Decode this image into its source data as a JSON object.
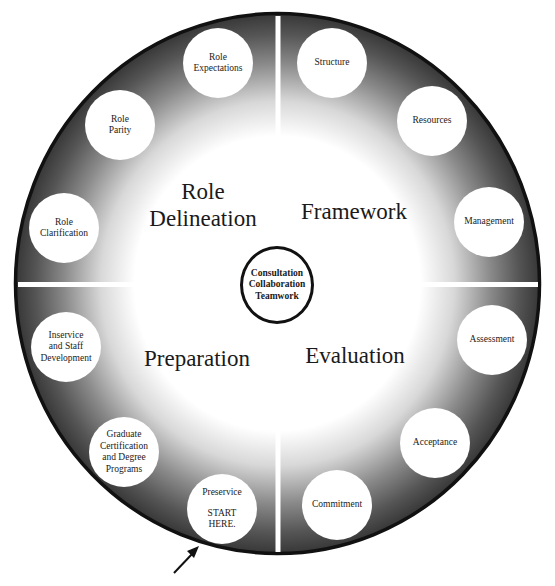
{
  "diagram": {
    "center": {
      "lines": [
        "Consultation",
        "Collaboration",
        "Teamwork"
      ]
    },
    "quadrants": [
      {
        "id": "role-delineation",
        "label_lines": [
          "Role",
          "Delineation"
        ],
        "nodes": [
          {
            "id": "role-expectations",
            "lines": [
              "Role",
              "Expectations"
            ]
          },
          {
            "id": "role-parity",
            "lines": [
              "Role",
              "Parity"
            ]
          },
          {
            "id": "role-clarification",
            "lines": [
              "Role",
              "Clarification"
            ]
          }
        ]
      },
      {
        "id": "framework",
        "label_lines": [
          "Framework"
        ],
        "nodes": [
          {
            "id": "structure",
            "lines": [
              "Structure"
            ]
          },
          {
            "id": "resources",
            "lines": [
              "Resources"
            ]
          },
          {
            "id": "management",
            "lines": [
              "Management"
            ]
          }
        ]
      },
      {
        "id": "preparation",
        "label_lines": [
          "Preparation"
        ],
        "nodes": [
          {
            "id": "inservice",
            "lines": [
              "Inservice",
              "and Staff",
              "Development"
            ]
          },
          {
            "id": "graduate",
            "lines": [
              "Graduate",
              "Certification",
              "and Degree",
              "Programs"
            ]
          },
          {
            "id": "preservice",
            "lines": [
              "Preservice"
            ],
            "extra_lines": [
              "START",
              "HERE."
            ]
          }
        ]
      },
      {
        "id": "evaluation",
        "label_lines": [
          "Evaluation"
        ],
        "nodes": [
          {
            "id": "assessment",
            "lines": [
              "Assessment"
            ]
          },
          {
            "id": "acceptance",
            "lines": [
              "Acceptance"
            ]
          },
          {
            "id": "commitment",
            "lines": [
              "Commitment"
            ]
          }
        ]
      }
    ],
    "start_arrow": {
      "icon": "arrow-up-right-icon",
      "target": "preservice"
    },
    "colors": {
      "ring_dark": "#3a3a3a",
      "ring_light": "#ffffff",
      "outline": "#111111",
      "divider": "#ffffff"
    }
  }
}
